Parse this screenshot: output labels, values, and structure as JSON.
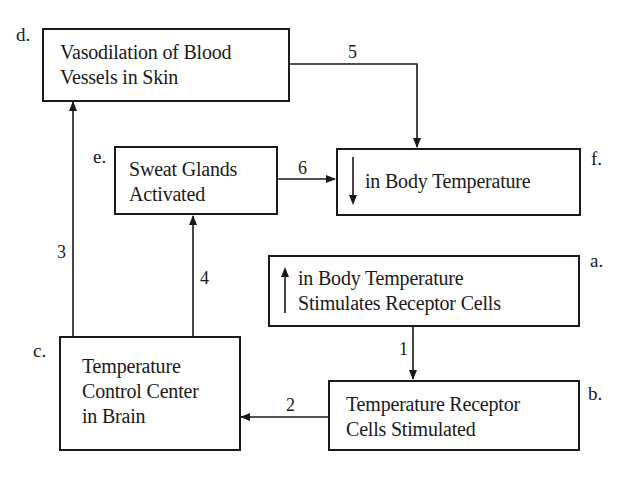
{
  "diagram": {
    "type": "flowchart",
    "topic": "Negative feedback regulation of body temperature",
    "nodes": [
      {
        "id": "a",
        "letter": "a.",
        "arrow_glyph": "up-arrow",
        "lines": [
          "in Body Temperature",
          "Stimulates Receptor Cells"
        ]
      },
      {
        "id": "b",
        "letter": "b.",
        "lines": [
          "Temperature Receptor",
          "Cells Stimulated"
        ]
      },
      {
        "id": "c",
        "letter": "c.",
        "lines": [
          "Temperature",
          "Control Center",
          "in Brain"
        ]
      },
      {
        "id": "d",
        "letter": "d.",
        "lines": [
          "Vasodilation of Blood",
          "Vessels in Skin"
        ]
      },
      {
        "id": "e",
        "letter": "e.",
        "lines": [
          "Sweat Glands",
          "Activated"
        ]
      },
      {
        "id": "f",
        "letter": "f.",
        "arrow_glyph": "down-arrow",
        "lines": [
          "in Body Temperature"
        ]
      }
    ],
    "edges": [
      {
        "label": "1",
        "from": "a",
        "to": "b"
      },
      {
        "label": "2",
        "from": "b",
        "to": "c"
      },
      {
        "label": "3",
        "from": "c",
        "to": "d"
      },
      {
        "label": "4",
        "from": "c",
        "to": "e"
      },
      {
        "label": "5",
        "from": "d",
        "to": "f"
      },
      {
        "label": "6",
        "from": "e",
        "to": "f"
      }
    ]
  }
}
